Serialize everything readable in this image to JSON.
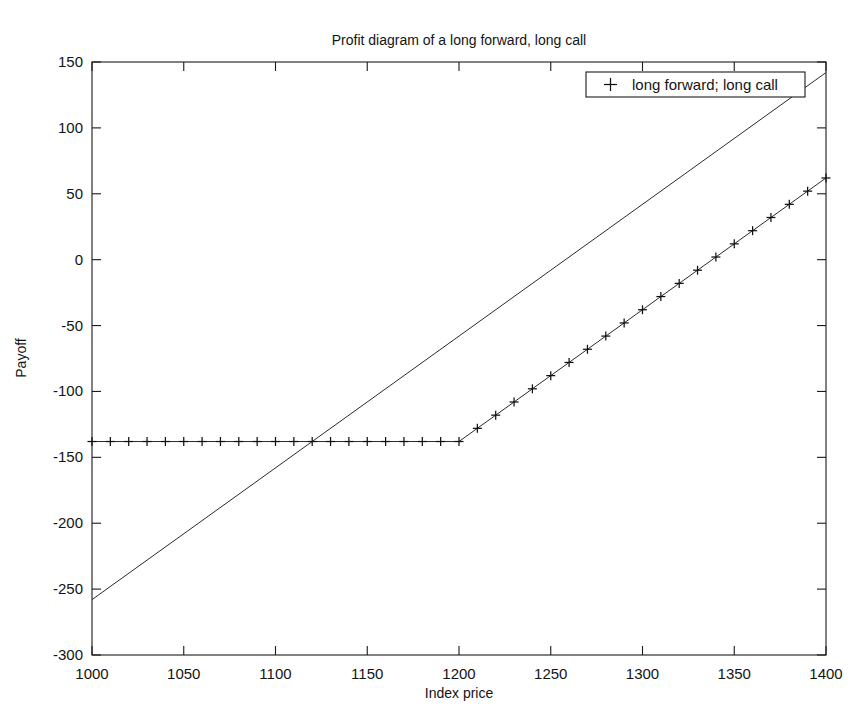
{
  "chart_data": {
    "type": "line",
    "title": "Profit diagram of a long forward, long call",
    "xlabel": "Index price",
    "ylabel": "Payoff",
    "xlim": [
      1000,
      1400
    ],
    "ylim": [
      -300,
      150
    ],
    "xticks": [
      1000,
      1050,
      1100,
      1150,
      1200,
      1250,
      1300,
      1350,
      1400
    ],
    "xtick_labels": [
      "1000",
      "1050",
      "1100",
      "1150",
      "1200",
      "1250",
      "1300",
      "1350",
      "1400"
    ],
    "yticks": [
      150,
      100,
      50,
      0,
      -50,
      -100,
      -150,
      -200,
      -250,
      -300
    ],
    "ytick_labels": [
      "150",
      "100",
      "50",
      "0",
      "-50",
      "-100",
      "-150",
      "-200",
      "-250",
      "-300"
    ],
    "grid": false,
    "legend": {
      "position": "top-right",
      "entries": [
        {
          "label": "long forward; long call",
          "marker": "+",
          "marker_symbol": "plus-marker"
        }
      ]
    },
    "series": [
      {
        "name": "long forward",
        "style": "solid-line",
        "marker": "none",
        "x": [
          1000,
          1400
        ],
        "values": [
          -258,
          142
        ]
      },
      {
        "name": "long call",
        "style": "solid-line-with-plus-markers",
        "marker": "+",
        "kink_x": 1200,
        "flat_level": -138,
        "x": [
          1000,
          1010,
          1020,
          1030,
          1040,
          1050,
          1060,
          1070,
          1080,
          1090,
          1100,
          1110,
          1120,
          1130,
          1140,
          1150,
          1160,
          1170,
          1180,
          1190,
          1200,
          1210,
          1220,
          1230,
          1240,
          1250,
          1260,
          1270,
          1280,
          1290,
          1300,
          1310,
          1320,
          1330,
          1340,
          1350,
          1360,
          1370,
          1380,
          1390,
          1400
        ],
        "values": [
          -138,
          -138,
          -138,
          -138,
          -138,
          -138,
          -138,
          -138,
          -138,
          -138,
          -138,
          -138,
          -138,
          -138,
          -138,
          -138,
          -138,
          -138,
          -138,
          -138,
          -138,
          -128,
          -118,
          -108,
          -98,
          -88,
          -78,
          -68,
          -58,
          -48,
          -38,
          -28,
          -18,
          -8,
          2,
          12,
          22,
          32,
          42,
          52,
          62
        ]
      }
    ],
    "annotations": {
      "forward_crosses_flat_at_x": 1120,
      "strike": 1200
    }
  }
}
